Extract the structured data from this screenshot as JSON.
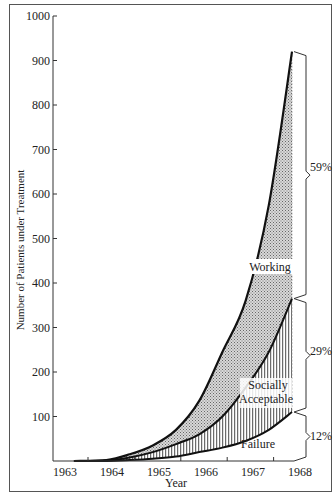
{
  "chart_data": {
    "type": "area",
    "title": "",
    "xlabel": "Year",
    "ylabel": "Number of Patients under Treatment",
    "x": [
      1963.3,
      1964,
      1964.5,
      1965,
      1965.5,
      1966,
      1966.5,
      1967,
      1967.5,
      1968
    ],
    "xticks": [
      "1963",
      "1964",
      "1965",
      "1966",
      "1967",
      "1968"
    ],
    "yticks": [
      "100",
      "200",
      "300",
      "400",
      "500",
      "600",
      "700",
      "800",
      "900",
      "1000"
    ],
    "ylim": [
      0,
      1000
    ],
    "xlim": [
      1963,
      1968
    ],
    "grid": false,
    "stacked": true,
    "series": [
      {
        "name": "Failure",
        "values": [
          0,
          0,
          2,
          5,
          10,
          20,
          30,
          45,
          70,
          110
        ],
        "pattern": "none"
      },
      {
        "name": "Socially Acceptable",
        "values": [
          0,
          1,
          6,
          15,
          28,
          40,
          70,
          120,
          175,
          255
        ],
        "pattern": "vertical-hatch"
      },
      {
        "name": "Working",
        "values": [
          0,
          1,
          7,
          15,
          32,
          75,
          145,
          195,
          330,
          555
        ],
        "pattern": "stipple"
      }
    ],
    "cumulative_top": {
      "Failure": [
        0,
        0,
        2,
        5,
        10,
        20,
        30,
        45,
        70,
        110
      ],
      "Socially Acceptable": [
        0,
        1,
        8,
        20,
        38,
        60,
        100,
        165,
        245,
        365
      ],
      "Working": [
        0,
        2,
        15,
        35,
        70,
        135,
        245,
        360,
        575,
        920
      ]
    },
    "annotations": [
      {
        "text": "Working",
        "x": 1967.3,
        "y": 405
      },
      {
        "text": "Socially Acceptable",
        "x": 1967.4,
        "y": 165
      },
      {
        "text": "Failure",
        "x": 1967.6,
        "y": 55
      }
    ],
    "brackets": [
      {
        "label": "59%",
        "from": 365,
        "to": 920
      },
      {
        "label": "29%",
        "from": 110,
        "to": 365
      },
      {
        "label": "12%",
        "from": 0,
        "to": 110
      }
    ]
  },
  "labels": {
    "xlabel": "Year",
    "ylabel": "Number of Patients under Treatment",
    "working": "Working",
    "socially": "Socially",
    "acceptable": "Acceptable",
    "failure": "Failure",
    "pct_working": "59%",
    "pct_social": "29%",
    "pct_failure": "12%"
  }
}
